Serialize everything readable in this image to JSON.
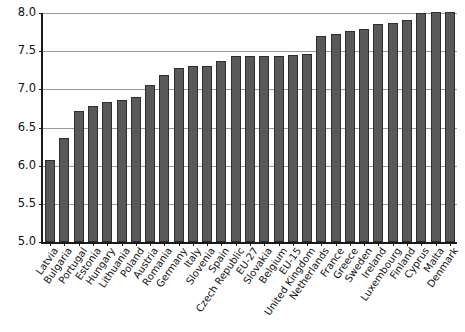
{
  "chart_data": {
    "type": "bar",
    "title": "",
    "subtitle": "",
    "xlabel": "",
    "ylabel": "",
    "ylim": [
      5.0,
      8.0
    ],
    "ytick_labels": [
      "8.0",
      "7.5",
      "7.0",
      "6.5",
      "6.0",
      "5.5",
      "5.0"
    ],
    "yticks": [
      8.0,
      7.5,
      7.0,
      6.5,
      6.0,
      5.5,
      5.0
    ],
    "grid": true,
    "legend": "none",
    "bar_color": "#595959",
    "bar_edge_color": "#2e2e2e",
    "axis_color": "#1a1a1a",
    "grid_color": "#9a9a9a",
    "categories": [
      "Latvia",
      "Bulgaria",
      "Portugal",
      "Estonia",
      "Hungary",
      "Lithuania",
      "Poland",
      "Austria",
      "Romania",
      "Germany",
      "Italy",
      "Slovenia",
      "Spain",
      "Czech Republic",
      "EU-27",
      "Slovakia",
      "Belgium",
      "EU-15",
      "United Kingdom",
      "Netherlands",
      "France",
      "Greece",
      "Sweden",
      "Ireland",
      "Luxembourg",
      "Finland",
      "Cyprus",
      "Malta",
      "Denmark"
    ],
    "values": [
      6.08,
      6.36,
      6.71,
      6.78,
      6.83,
      6.86,
      6.9,
      7.06,
      7.19,
      7.28,
      7.3,
      7.3,
      7.37,
      7.44,
      7.44,
      7.44,
      7.44,
      7.45,
      7.46,
      7.7,
      7.73,
      7.76,
      7.79,
      7.85,
      7.87,
      7.91,
      8.0,
      8.01,
      8.01
    ]
  }
}
